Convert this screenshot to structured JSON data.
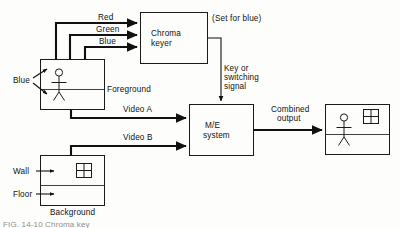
{
  "figure": {
    "caption_partial": "FIG. 14-10   Chroma key",
    "bg_color": "#fdfdfc",
    "line_color": "#111111"
  },
  "boxes": {
    "chroma_keyer": {
      "label_line1": "Chroma",
      "label_line2": "keyer",
      "name": "chroma-keyer"
    },
    "me_system": {
      "label_line1": "M/E",
      "label_line2": "system",
      "name": "me-system"
    },
    "foreground": {
      "label": "Foreground",
      "name": "foreground-monitor"
    },
    "background": {
      "label": "Background",
      "name": "background-monitor"
    },
    "output": {
      "label": "",
      "name": "output-monitor"
    }
  },
  "signals": {
    "red": "Red",
    "green": "Green",
    "blue": "Blue",
    "video_a": "Video A",
    "video_b": "Video B",
    "key_line1": "Key  or",
    "key_line2": "switching",
    "key_line3": "signal",
    "combined_line1": "Combined",
    "combined_line2": "output",
    "set_for_blue": "(Set for blue)"
  },
  "annotations": {
    "blue_backing": "Blue",
    "wall": "Wall",
    "floor": "Floor"
  }
}
